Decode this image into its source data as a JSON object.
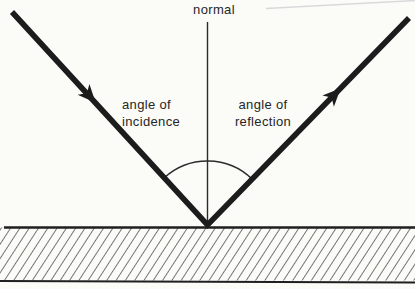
{
  "diagram": {
    "labels": {
      "normal": "normal",
      "incidence_line1": "angle of",
      "incidence_line2": "incidence",
      "reflection_line1": "angle of",
      "reflection_line2": "reflection"
    },
    "colors": {
      "ray_ink": "#1c1c1c",
      "thin_line": "#2b2b2b",
      "hatch_line": "#2e2e2e",
      "text": "#262626",
      "background": "#fbfbf8",
      "page_edge_artifact": "#d9d9d9"
    }
  }
}
